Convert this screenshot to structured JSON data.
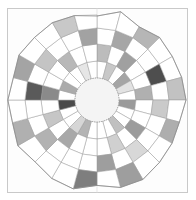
{
  "page": {
    "background_color": "#ffffff",
    "corner_mark": "",
    "frame": {
      "border_color": "#c9c9c9",
      "fill_color": "#fdfdfd"
    }
  },
  "figure": {
    "title": "",
    "caption": "",
    "type": "polar-grid-heatmap",
    "center": {
      "x": 90,
      "y": 92
    },
    "inner_hole_radius": 22,
    "outer_radius": 88,
    "ring_count": 4,
    "sector_count": 24,
    "start_angle_deg": -90,
    "stroke_color": "#9a9a9a",
    "stroke_width": 0.5,
    "outline_color": "#8a8a8a",
    "hub_fill": "#f4f4f4",
    "hub_stroke": "#9a9a9a",
    "crosshair_color": "#d9d9d9",
    "ring_radii": [
      22,
      39,
      56,
      72,
      88
    ],
    "wobble_amplitude": 4
  },
  "chart_data": {
    "type": "heatmap",
    "title": "",
    "subtitle": "",
    "xlabel": "",
    "ylabel": "",
    "legend": [],
    "grid": true,
    "projection": "polar",
    "categories": [
      "s1",
      "s2",
      "s3",
      "s4",
      "s5",
      "s6",
      "s7",
      "s8",
      "s9",
      "s10",
      "s11",
      "s12",
      "s13",
      "s14",
      "s15",
      "s16",
      "s17",
      "s18",
      "s19",
      "s20",
      "s21",
      "s22",
      "s23",
      "s24"
    ],
    "rings": [
      "r1-inner",
      "r2",
      "r3",
      "r4-outer"
    ],
    "value_range": [
      0,
      100
    ],
    "palette": {
      "0": "#ffffff",
      "15": "#f0f0f0",
      "30": "#dcdcdc",
      "45": "#c2c2c2",
      "60": "#a8a8a8",
      "75": "#8c8c8c",
      "88": "#6e6e6e",
      "100": "#4a4a4a"
    },
    "series": [
      {
        "name": "r1-inner",
        "values": [
          0,
          28,
          0,
          55,
          18,
          0,
          62,
          0,
          0,
          30,
          0,
          0,
          0,
          40,
          22,
          0,
          0,
          95,
          0,
          48,
          0,
          0,
          15,
          0
        ]
      },
      {
        "name": "r2",
        "values": [
          36,
          0,
          58,
          0,
          0,
          44,
          0,
          0,
          60,
          0,
          25,
          0,
          0,
          0,
          52,
          0,
          30,
          0,
          72,
          0,
          0,
          38,
          0,
          0
        ]
      },
      {
        "name": "r3",
        "values": [
          0,
          50,
          0,
          0,
          92,
          0,
          26,
          0,
          0,
          20,
          0,
          62,
          0,
          0,
          0,
          46,
          0,
          0,
          86,
          0,
          34,
          0,
          0,
          56
        ]
      },
      {
        "name": "r4-outer",
        "values": [
          0,
          0,
          40,
          0,
          0,
          33,
          0,
          52,
          0,
          0,
          60,
          0,
          75,
          0,
          0,
          0,
          44,
          0,
          0,
          58,
          0,
          0,
          30,
          0
        ]
      }
    ],
    "cell_colors": [
      [
        "#ffffff",
        "#c8c8c8",
        "#ffffff",
        "#a5a5a5",
        "#e2e2e2",
        "#ffffff",
        "#9a9a9a",
        "#ffffff",
        "#ffffff",
        "#c0c0c0",
        "#ffffff",
        "#ffffff",
        "#ffffff",
        "#b4b4b4",
        "#d6d6d6",
        "#ffffff",
        "#ffffff",
        "#4a4a4a",
        "#ffffff",
        "#ababab",
        "#ffffff",
        "#ffffff",
        "#e6e6e6",
        "#ffffff"
      ],
      [
        "#bcbcbc",
        "#ffffff",
        "#a0a0a0",
        "#ffffff",
        "#ffffff",
        "#b0b0b0",
        "#ffffff",
        "#ffffff",
        "#9c9c9c",
        "#ffffff",
        "#d0d0d0",
        "#ffffff",
        "#ffffff",
        "#ffffff",
        "#a8a8a8",
        "#ffffff",
        "#c6c6c6",
        "#ffffff",
        "#8a8a8a",
        "#ffffff",
        "#ffffff",
        "#b8b8b8",
        "#ffffff",
        "#ffffff"
      ],
      [
        "#ffffff",
        "#a6a6a6",
        "#ffffff",
        "#ffffff",
        "#4e4e4e",
        "#ffffff",
        "#cacaca",
        "#ffffff",
        "#ffffff",
        "#d8d8d8",
        "#ffffff",
        "#9e9e9e",
        "#ffffff",
        "#ffffff",
        "#ffffff",
        "#b2b2b2",
        "#ffffff",
        "#ffffff",
        "#5a5a5a",
        "#ffffff",
        "#c4c4c4",
        "#ffffff",
        "#ffffff",
        "#a2a2a2"
      ],
      [
        "#ffffff",
        "#ffffff",
        "#b6b6b6",
        "#ffffff",
        "#ffffff",
        "#c2c2c2",
        "#ffffff",
        "#aeaeae",
        "#ffffff",
        "#ffffff",
        "#9e9e9e",
        "#ffffff",
        "#7e7e7e",
        "#ffffff",
        "#ffffff",
        "#ffffff",
        "#b0b0b0",
        "#ffffff",
        "#ffffff",
        "#a4a4a4",
        "#ffffff",
        "#ffffff",
        "#c8c8c8",
        "#ffffff"
      ]
    ]
  }
}
